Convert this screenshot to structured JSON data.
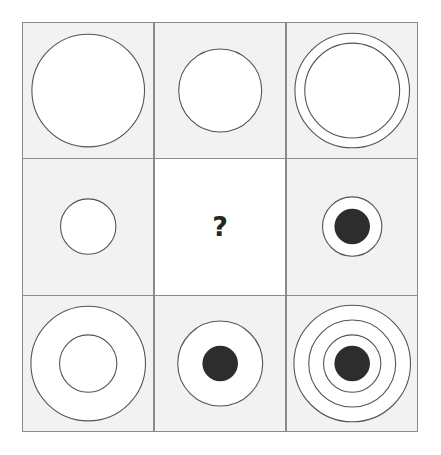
{
  "puzzle": {
    "type": "matrix-reasoning",
    "title": "Visual Analogy Matrix",
    "rows": 3,
    "columns": 3,
    "missing_cell_index": 4,
    "missing_cell_marker": "?",
    "colors": {
      "page_background": "#ffffff",
      "cell_background": "#f2f2f2",
      "blank_cell_background": "#ffffff",
      "grid_line": "#8a8a8a",
      "shape_stroke": "#545454",
      "shape_fill": "#ffffff",
      "solid_fill": "#2d2d2d",
      "marker_color": "#262626"
    },
    "cells": [
      {
        "index": 0,
        "row": 1,
        "column": 1,
        "name": "cell-r1c1",
        "description": "one large outlined circle",
        "ring_count": 1,
        "has_solid_center": false,
        "radii": [
          57
        ]
      },
      {
        "index": 1,
        "row": 1,
        "column": 2,
        "name": "cell-r1c2",
        "description": "one medium outlined circle",
        "ring_count": 1,
        "has_solid_center": false,
        "radii": [
          42
        ]
      },
      {
        "index": 2,
        "row": 1,
        "column": 3,
        "name": "cell-r1c3",
        "description": "two concentric outlined circles",
        "ring_count": 2,
        "has_solid_center": false,
        "radii": [
          58,
          48
        ]
      },
      {
        "index": 3,
        "row": 2,
        "column": 1,
        "name": "cell-r2c1",
        "description": "one small outlined circle",
        "ring_count": 1,
        "has_solid_center": false,
        "radii": [
          28
        ]
      },
      {
        "index": 4,
        "row": 2,
        "column": 2,
        "name": "cell-r2c2-missing",
        "description": "missing cell marked with a question mark",
        "ring_count": 0,
        "has_solid_center": false,
        "radii": [],
        "is_missing": true
      },
      {
        "index": 5,
        "row": 2,
        "column": 3,
        "name": "cell-r2c3",
        "description": "small outlined circle with solid filled center",
        "ring_count": 1,
        "has_solid_center": true,
        "radii": [
          30
        ],
        "solid_radius": 18
      },
      {
        "index": 6,
        "row": 3,
        "column": 1,
        "name": "cell-r3c1",
        "description": "large outlined circle with medium concentric circle inside",
        "ring_count": 2,
        "has_solid_center": false,
        "radii": [
          58,
          29
        ]
      },
      {
        "index": 7,
        "row": 3,
        "column": 2,
        "name": "cell-r3c2",
        "description": "medium outlined circle with solid filled center",
        "ring_count": 1,
        "has_solid_center": true,
        "radii": [
          43
        ],
        "solid_radius": 18
      },
      {
        "index": 8,
        "row": 3,
        "column": 3,
        "name": "cell-r3c3",
        "description": "three concentric outlined circles with solid filled center",
        "ring_count": 3,
        "has_solid_center": true,
        "radii": [
          59,
          44,
          29
        ],
        "solid_radius": 18
      }
    ]
  }
}
